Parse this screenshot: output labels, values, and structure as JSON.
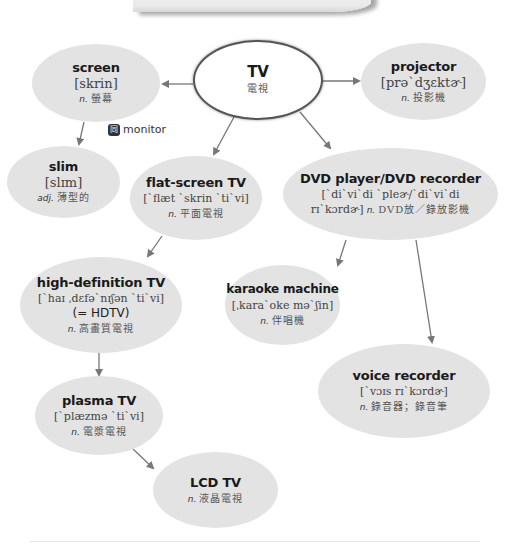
{
  "diagram": {
    "type": "vocabulary mind map",
    "center": {
      "term": "TV",
      "definition": "電視"
    },
    "nodes": {
      "screen": {
        "term": "screen",
        "ipa": "[skrin]",
        "pos": "n.",
        "definition": "螢幕"
      },
      "projector": {
        "term": "projector",
        "ipa": "[prəˋdʒɛktɚ]",
        "pos": "n.",
        "definition": "投影機"
      },
      "slim": {
        "term": "slim",
        "ipa": "[slɪm]",
        "pos": "adj.",
        "definition": "薄型的"
      },
      "flat_screen": {
        "term": "flat-screen TV",
        "ipa": "[ˋflæt ˋskrin ˋtiˋvi]",
        "pos": "n.",
        "definition": "平面電視"
      },
      "dvd": {
        "term": "DVD player/DVD recorder",
        "ipa_line1": "[ˋdiˋviˋdi ˋpleɚ/ˋdiˋviˋdi",
        "ipa_line2": "rɪˋkɔrdɚ]",
        "pos": "n.",
        "definition": "DVD放／錄放影機"
      },
      "hdtv": {
        "term": "high-definition TV",
        "ipa": "[ˋhaɪ ˌdɛfəˋnɪʃən ˋtiˋvi]",
        "alt": "(= HDTV)",
        "pos": "n.",
        "definition": "高畫質電視"
      },
      "karaoke": {
        "term": "karaoke machine",
        "ipa": "[ˌkaraˋoke məˋʃin]",
        "pos": "n.",
        "definition": "伴唱機"
      },
      "voice_recorder": {
        "term": "voice recorder",
        "ipa": "[ˋvɔɪs rɪˋkɔrdɚ]",
        "pos": "n.",
        "definition": "錄音器；錄音筆"
      },
      "plasma": {
        "term": "plasma TV",
        "ipa": "[ˋplæzmə ˋtiˋvi]",
        "pos": "n.",
        "definition": "電漿電視"
      },
      "lcd": {
        "term": "LCD TV",
        "pos": "n.",
        "definition": "液晶電視"
      }
    },
    "synonym": {
      "icon": "同",
      "icon_name": "synonym-icon",
      "word": "monitor"
    },
    "edges": [
      [
        "TV",
        "screen"
      ],
      [
        "TV",
        "projector"
      ],
      [
        "TV",
        "flat-screen TV"
      ],
      [
        "TV",
        "DVD player/DVD recorder"
      ],
      [
        "screen",
        "slim"
      ],
      [
        "flat-screen TV",
        "high-definition TV"
      ],
      [
        "high-definition TV",
        "plasma TV"
      ],
      [
        "plasma TV",
        "LCD TV"
      ],
      [
        "DVD player/DVD recorder",
        "karaoke machine"
      ],
      [
        "DVD player/DVD recorder",
        "voice recorder"
      ]
    ],
    "colors": {
      "node_fill": "#e3e3e3",
      "center_fill": "#ffffff",
      "center_border": "#555555",
      "line": "#777777"
    }
  }
}
